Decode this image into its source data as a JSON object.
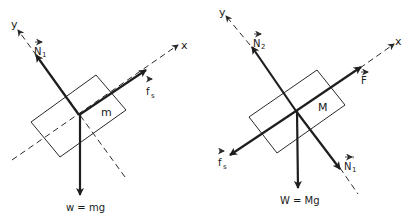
{
  "diagrams": [
    {
      "id": "block-m",
      "mass_label": "m",
      "axes": {
        "x_label": "x",
        "y_label": "y"
      },
      "forces": {
        "normal": {
          "label": "N",
          "sub": "1"
        },
        "friction": {
          "label": "f",
          "sub": "s"
        },
        "weight": {
          "label": "w = mg"
        }
      }
    },
    {
      "id": "block-M",
      "mass_label": "M",
      "axes": {
        "x_label": "x",
        "y_label": "y"
      },
      "forces": {
        "normal": {
          "label": "N",
          "sub": "2"
        },
        "applied": {
          "label": "F"
        },
        "friction": {
          "label": "f",
          "sub": "s"
        },
        "reaction": {
          "label": "N",
          "sub": "1",
          "prime": "'"
        },
        "weight": {
          "label": "W = Mg"
        }
      }
    }
  ],
  "colors": {
    "ink": "#1e1e1e",
    "background": "#ffffff"
  }
}
